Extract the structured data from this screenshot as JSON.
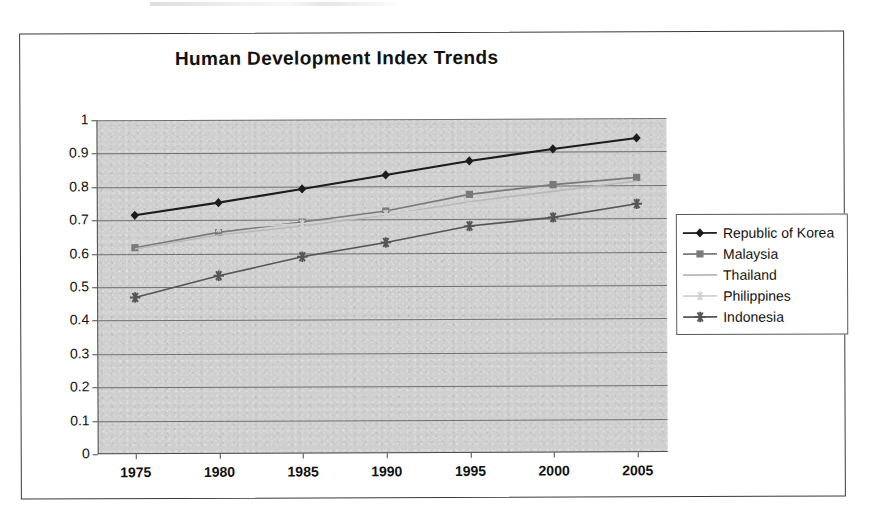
{
  "chart_data": {
    "type": "line",
    "title": "Human Development Index Trends",
    "xlabel": "",
    "ylabel": "",
    "x": [
      1975,
      1980,
      1985,
      1990,
      1995,
      2000,
      2005
    ],
    "categories": [
      "1975",
      "1980",
      "1985",
      "1990",
      "1995",
      "2000",
      "2005"
    ],
    "xtick_labels": [
      "1975",
      "1980",
      "1985",
      "1990",
      "1995",
      "2000",
      "2005"
    ],
    "ytick_labels": [
      "1",
      "0.9",
      "0.8",
      "0.7",
      "0.6",
      "0.5",
      "0.4",
      "0.3",
      "0.2",
      "0.1",
      "0"
    ],
    "ytick_values": [
      1,
      0.9,
      0.8,
      0.7,
      0.6,
      0.5,
      0.4,
      0.3,
      0.2,
      0.1,
      0
    ],
    "ylim": [
      0,
      1
    ],
    "grid": "horizontal",
    "legend_position": "right",
    "plot_background": "#cfcfcf",
    "series": [
      {
        "name": "Republic of Korea",
        "marker": "diamond",
        "color": "#1c1c1c",
        "values": [
          0.715,
          0.752,
          0.792,
          0.833,
          0.874,
          0.909,
          0.941
        ]
      },
      {
        "name": "Malaysia",
        "marker": "square",
        "color": "#7a7a7a",
        "values": [
          0.618,
          0.663,
          0.693,
          0.725,
          0.774,
          0.802,
          0.823
        ]
      },
      {
        "name": "Thailand",
        "marker": "none",
        "color": "#b9b9b9",
        "values": [
          0.614,
          0.655,
          0.681,
          0.713,
          0.752,
          0.782,
          0.812
        ]
      },
      {
        "name": "Philippines",
        "marker": "star",
        "color": "#d2d2d2",
        "values": [
          0.653,
          0.676,
          0.688,
          0.716,
          0.739,
          0.759,
          0.785
        ]
      },
      {
        "name": "Indonesia",
        "marker": "asterisk",
        "color": "#555555",
        "values": [
          0.469,
          0.533,
          0.589,
          0.631,
          0.679,
          0.704,
          0.744
        ]
      }
    ]
  }
}
